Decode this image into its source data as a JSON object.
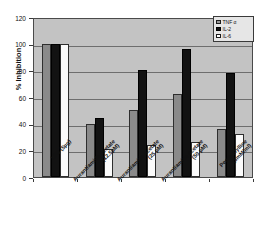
{
  "chart_data": {
    "type": "bar",
    "title": "",
    "xlabel": "",
    "ylabel": "% Inhibition",
    "ylim": [
      0,
      120
    ],
    "yticks": [
      0,
      20,
      40,
      60,
      80,
      100,
      120
    ],
    "grid": true,
    "legend_position": "top-right",
    "categories": [
      "LPS (5µg)",
      "Aurantiamide acetate (12.5µM)",
      "Aurantiamide acetate (25 µM)",
      "Aurantiamide acetate (50 µM)",
      "Pentoxifylline (5mM/ml)"
    ],
    "category_lines": [
      [
        "LPS (5µg)"
      ],
      [
        "Aurantiamide acetate",
        "(12.5µM)"
      ],
      [
        "Aurantiamide acetate",
        "(25 µM)"
      ],
      [
        "Aurantiamide acetate",
        "(50 µM)"
      ],
      [
        "Pentoxifylline",
        "(5mM/ml)"
      ]
    ],
    "series": [
      {
        "name": "TNF α",
        "color": "#8a8a8a",
        "values": [
          100,
          40,
          50,
          62,
          36
        ]
      },
      {
        "name": "IL-2",
        "color": "#121212",
        "values": [
          100,
          44,
          80,
          96,
          78
        ]
      },
      {
        "name": "IL-6",
        "color": "#fbfbfb",
        "values": [
          100,
          21,
          24,
          26,
          32
        ]
      }
    ]
  },
  "legend": {
    "items": [
      {
        "label": "TNF α"
      },
      {
        "label": "IL-2"
      },
      {
        "label": "IL-6"
      }
    ]
  },
  "axis": {
    "y_title": "% Inhibition",
    "y_tick_labels": [
      "120",
      "100",
      "80",
      "60",
      "40",
      "20",
      "0"
    ]
  },
  "colors": {
    "plot_background": "#c3c3c3",
    "gridline": "#6e6e6e",
    "frame": "#4a4a4a",
    "tnf": "#8a8a8a",
    "il2": "#121212",
    "il6": "#fbfbfb"
  }
}
